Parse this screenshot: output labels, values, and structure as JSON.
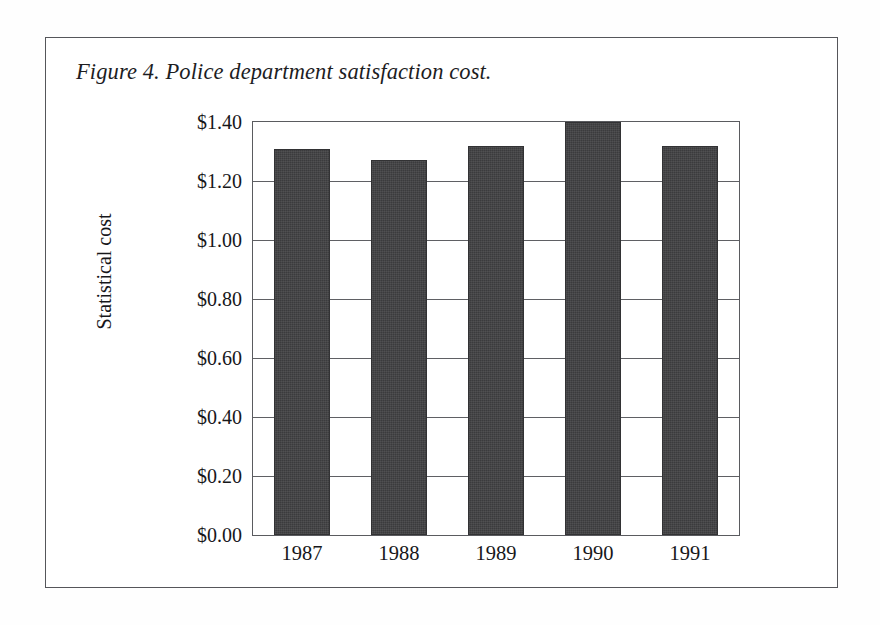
{
  "figure": {
    "caption": "Figure 4. Police department satisfaction cost."
  },
  "chart_data": {
    "type": "bar",
    "title": "Figure 4. Police department satisfaction cost.",
    "xlabel": "",
    "ylabel": "Statistical cost",
    "categories": [
      "1987",
      "1988",
      "1989",
      "1990",
      "1991"
    ],
    "values": [
      1.31,
      1.27,
      1.32,
      1.4,
      1.32
    ],
    "value_labels": [
      "$1.31",
      "$1.27",
      "$1.32",
      "$1.40",
      "$1.32"
    ],
    "ylim": [
      0.0,
      1.4
    ],
    "ytick_values": [
      0.0,
      0.2,
      0.4,
      0.6,
      0.8,
      1.0,
      1.2,
      1.4
    ],
    "ytick_labels": [
      "$0.00",
      "$0.20",
      "$0.40",
      "$0.60",
      "$0.80",
      "$1.00",
      "$1.20",
      "$1.40"
    ],
    "grid": "horizontal",
    "legend": "none",
    "bar_color": "#3b3b3d",
    "frame_color": "#5a5b5f",
    "background": "#ffffff"
  }
}
